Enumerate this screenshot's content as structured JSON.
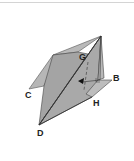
{
  "diagram": {
    "type": "3d-geometry-folded-planes",
    "labels": {
      "G": "G",
      "B": "B",
      "C": "C",
      "H": "H",
      "D": "D"
    },
    "colors": {
      "plane_dark": "#9a9a9a",
      "plane_mid": "#b0b0b0",
      "plane_light": "#c4c4c4",
      "edge": "#3a3a3a",
      "label": "#222222",
      "top_rule": "#d4d4d4"
    }
  }
}
